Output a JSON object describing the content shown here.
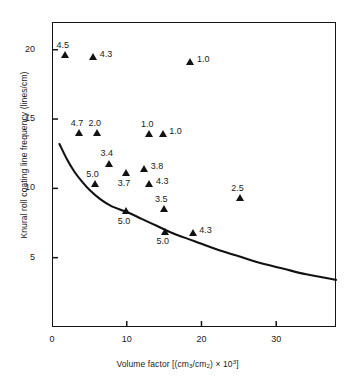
{
  "chart_data": {
    "type": "scatter",
    "title": "",
    "xlabel": "Volume factor [(cm3/cm2) × 10^3]",
    "ylabel": "Knural roll coating line frequency (lines/cm)",
    "xlabel_parts": {
      "lead": "Volume factor [(cm",
      "sub1": "3",
      "mid": "/cm",
      "sub2": "2",
      "close": ") × 10",
      "sup": "3",
      "tail": "]"
    },
    "xlim": [
      0,
      38
    ],
    "ylim": [
      0,
      22
    ],
    "xticks": [
      0,
      10,
      20,
      30
    ],
    "xtick_labels": [
      "0",
      "10",
      "20",
      "30"
    ],
    "yticks": [
      5,
      10,
      15,
      20
    ],
    "ytick_labels": [
      "5",
      "10",
      "15",
      "20"
    ],
    "grid": false,
    "legend": "none",
    "marker": "filled-triangle",
    "marker_color": "#121212",
    "points": [
      {
        "x": 1.8,
        "y": 19.6,
        "label": "4.5",
        "lpos": "above"
      },
      {
        "x": 5.6,
        "y": 19.5,
        "label": "4.3",
        "lpos": "right"
      },
      {
        "x": 18.6,
        "y": 19.1,
        "label": "1.0",
        "lpos": "right"
      },
      {
        "x": 3.7,
        "y": 14.0,
        "label": "4.7",
        "lpos": "above"
      },
      {
        "x": 6.1,
        "y": 14.0,
        "label": "2.0",
        "lpos": "above"
      },
      {
        "x": 13.1,
        "y": 13.9,
        "label": "1.0",
        "lpos": "above"
      },
      {
        "x": 14.9,
        "y": 13.9,
        "label": "1.0",
        "lpos": "right"
      },
      {
        "x": 7.7,
        "y": 11.8,
        "label": "3.4",
        "lpos": "above"
      },
      {
        "x": 12.4,
        "y": 11.4,
        "label": "3.8",
        "lpos": "right"
      },
      {
        "x": 10.0,
        "y": 11.1,
        "label": "3.7",
        "lpos": "below"
      },
      {
        "x": 5.8,
        "y": 10.3,
        "label": "5.0",
        "lpos": "above"
      },
      {
        "x": 13.1,
        "y": 10.3,
        "label": "4.3",
        "lpos": "right"
      },
      {
        "x": 25.2,
        "y": 9.3,
        "label": "2.5",
        "lpos": "above"
      },
      {
        "x": 15.0,
        "y": 8.5,
        "label": "3.5",
        "lpos": "above"
      },
      {
        "x": 10.0,
        "y": 8.4,
        "label": "5.0",
        "lpos": "below"
      },
      {
        "x": 15.2,
        "y": 6.9,
        "label": "5.0",
        "lpos": "below"
      },
      {
        "x": 18.9,
        "y": 6.8,
        "label": "4.3",
        "lpos": "right"
      }
    ],
    "curve": {
      "name": "limit curve",
      "color": "#121212",
      "points": [
        {
          "x": 1.0,
          "y": 13.2
        },
        {
          "x": 2.0,
          "y": 12.1
        },
        {
          "x": 3.0,
          "y": 11.2
        },
        {
          "x": 4.0,
          "y": 10.5
        },
        {
          "x": 5.0,
          "y": 9.9
        },
        {
          "x": 6.5,
          "y": 9.2
        },
        {
          "x": 8.0,
          "y": 8.7
        },
        {
          "x": 10.0,
          "y": 8.3
        },
        {
          "x": 12.0,
          "y": 7.8
        },
        {
          "x": 14.0,
          "y": 7.3
        },
        {
          "x": 16.0,
          "y": 6.8
        },
        {
          "x": 19.0,
          "y": 6.2
        },
        {
          "x": 22.0,
          "y": 5.6
        },
        {
          "x": 25.0,
          "y": 5.1
        },
        {
          "x": 28.0,
          "y": 4.6
        },
        {
          "x": 31.0,
          "y": 4.2
        },
        {
          "x": 34.0,
          "y": 3.8
        },
        {
          "x": 38.0,
          "y": 3.4
        }
      ]
    }
  }
}
